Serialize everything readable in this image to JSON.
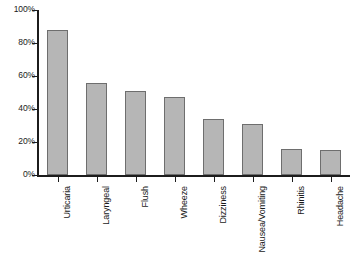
{
  "chart_data": {
    "type": "bar",
    "title": "",
    "subtitle": "",
    "xlabel": "",
    "ylabel": "",
    "categories": [
      "Urticaria",
      "Laryngeal",
      "Flush",
      "Wheeze",
      "Dizziness",
      "Nausea/Vomiting",
      "Rhinitis",
      "Headache"
    ],
    "values": [
      88,
      56,
      51,
      47,
      34,
      31,
      16,
      15
    ],
    "ylim": [
      0,
      100
    ],
    "yticks": [
      0,
      20,
      40,
      60,
      80,
      100
    ],
    "ytick_labels": [
      "0%",
      "20%",
      "40%",
      "60%",
      "80%",
      "100%"
    ],
    "grid": false,
    "legend": false,
    "legend_position": "none",
    "bar_fill_color": "#b6b6b6",
    "bar_border_color": "#6e6e6e",
    "axis_color": "#1c1c1c",
    "background_color": "#ffffff"
  }
}
